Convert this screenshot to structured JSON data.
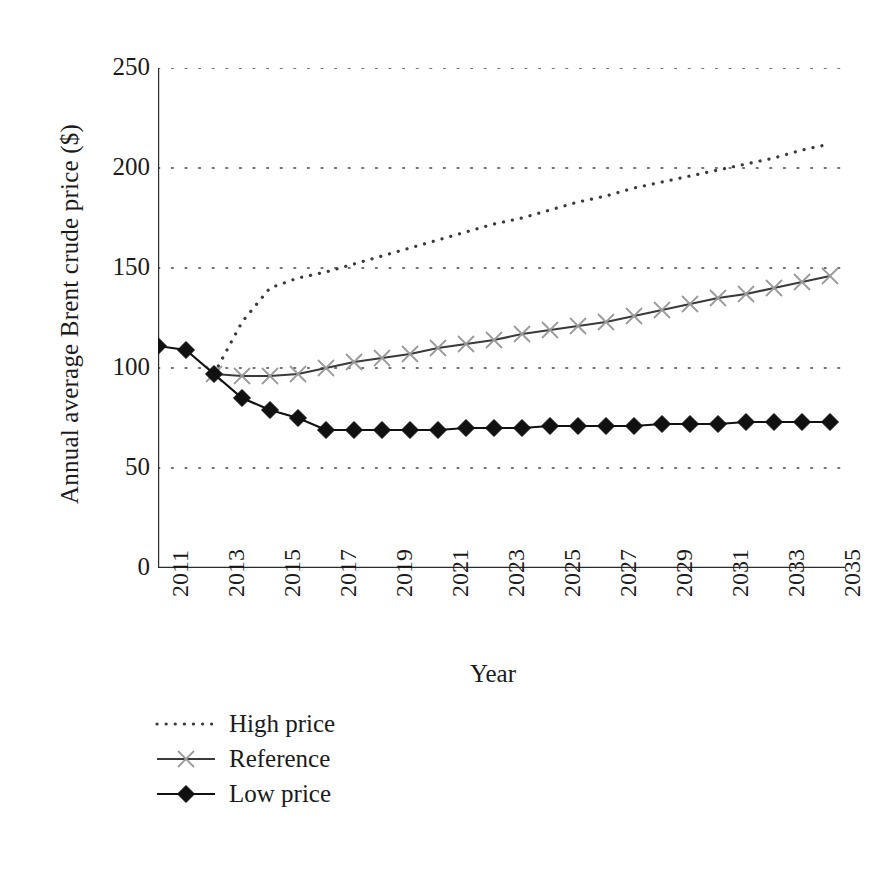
{
  "chart_data": {
    "type": "line",
    "title": "",
    "xlabel": "Year",
    "ylabel": "Annual average Brent crude price ($)",
    "xlim": [
      2011,
      2035
    ],
    "ylim": [
      0,
      250
    ],
    "yticks": [
      0,
      50,
      100,
      150,
      200,
      250
    ],
    "xticks": [
      2011,
      2013,
      2015,
      2017,
      2019,
      2021,
      2023,
      2025,
      2027,
      2029,
      2031,
      2033,
      2035
    ],
    "xtick_labels": [
      "2011",
      "2013",
      "2015",
      "2017",
      "2019",
      "2021",
      "2023",
      "2025",
      "2027",
      "2029",
      "2031",
      "2033",
      "2035"
    ],
    "x_minor_ticks_every": 1,
    "grid": "horizontal-dotted",
    "legend_position": "below-left",
    "x": [
      2011,
      2012,
      2013,
      2014,
      2015,
      2016,
      2017,
      2018,
      2019,
      2020,
      2021,
      2022,
      2023,
      2024,
      2025,
      2026,
      2027,
      2028,
      2029,
      2030,
      2031,
      2032,
      2033,
      2034,
      2035
    ],
    "series": [
      {
        "name": "High price",
        "marker": "none",
        "line": "dotted",
        "color": "#3a3a3a",
        "x": [
          2013,
          2014,
          2015,
          2016,
          2017,
          2018,
          2019,
          2020,
          2021,
          2022,
          2023,
          2024,
          2025,
          2026,
          2027,
          2028,
          2029,
          2030,
          2031,
          2032,
          2033,
          2034,
          2035
        ],
        "values": [
          97,
          123,
          140,
          145,
          148,
          152,
          156,
          160,
          164,
          168,
          172,
          175,
          179,
          183,
          186,
          190,
          193,
          196,
          199,
          202,
          205,
          209,
          212
        ]
      },
      {
        "name": "Reference",
        "marker": "x",
        "line": "solid",
        "color": "#3a3a3a",
        "x": [
          2013,
          2014,
          2015,
          2016,
          2017,
          2018,
          2019,
          2020,
          2021,
          2022,
          2023,
          2024,
          2025,
          2026,
          2027,
          2028,
          2029,
          2030,
          2031,
          2032,
          2033,
          2034,
          2035
        ],
        "values": [
          97,
          96,
          96,
          97,
          100,
          103,
          105,
          107,
          110,
          112,
          114,
          117,
          119,
          121,
          123,
          126,
          129,
          132,
          135,
          137,
          140,
          143,
          146
        ]
      },
      {
        "name": "Low price",
        "marker": "diamond",
        "line": "solid",
        "color": "#111111",
        "x": [
          2011,
          2012,
          2013,
          2014,
          2015,
          2016,
          2017,
          2018,
          2019,
          2020,
          2021,
          2022,
          2023,
          2024,
          2025,
          2026,
          2027,
          2028,
          2029,
          2030,
          2031,
          2032,
          2033,
          2034,
          2035
        ],
        "values": [
          111,
          109,
          97,
          85,
          79,
          75,
          69,
          69,
          69,
          69,
          69,
          70,
          70,
          70,
          71,
          71,
          71,
          71,
          72,
          72,
          72,
          73,
          73,
          73,
          73
        ]
      }
    ]
  },
  "legend": {
    "items": [
      {
        "label": "High price"
      },
      {
        "label": "Reference"
      },
      {
        "label": "Low price"
      }
    ]
  }
}
